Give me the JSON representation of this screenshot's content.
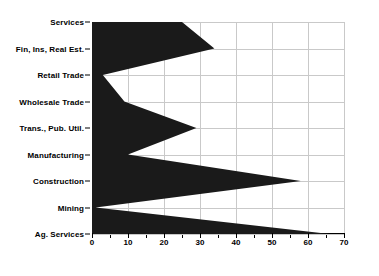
{
  "chart_data": {
    "type": "area",
    "orientation": "horizontal",
    "title": "",
    "subtitle": "",
    "xlabel": "",
    "ylabel": "",
    "categories": [
      "Services",
      "Fin, Ins, Real Est.",
      "Retail Trade",
      "Wholesale Trade",
      "Trans., Pub. Util.",
      "Manufacturing",
      "Construction",
      "Mining",
      "Ag. Services"
    ],
    "values": [
      25,
      34,
      3,
      9,
      29,
      10,
      58,
      1,
      66
    ],
    "series": [
      {
        "name": "",
        "values": [
          25,
          34,
          3,
          9,
          29,
          10,
          58,
          1,
          66
        ]
      }
    ],
    "xlim": [
      0,
      70
    ],
    "xticks": [
      0,
      10,
      20,
      30,
      40,
      50,
      60,
      70
    ],
    "xticklabels": [
      "0",
      "10",
      "20",
      "30",
      "40",
      "50",
      "60",
      "70"
    ],
    "xminorticks": [
      5,
      15,
      25,
      35,
      45,
      55,
      65
    ],
    "grid": true,
    "grid_axis": "both",
    "legend": false,
    "legend_position": "none",
    "fill_color": "#1a1a1a",
    "grid_color": "#c9c9c9",
    "axis_color": "#000000",
    "background_color": "#ffffff"
  }
}
